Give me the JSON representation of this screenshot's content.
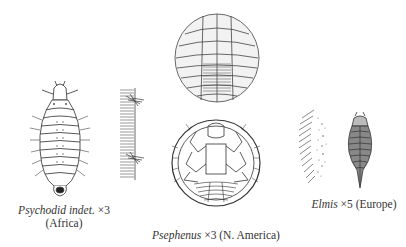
{
  "figure": {
    "specimens": [
      {
        "id": "psychodid",
        "genus": "Psychodid indet.",
        "magnification": "×3",
        "region": "(Africa)",
        "caption_line1_rest": " ×3",
        "caption_line2": "(Africa)",
        "views": [
          "dorsal larva"
        ]
      },
      {
        "id": "psephenus",
        "genus": "Psephenus",
        "magnification": "×3",
        "region": "(N. America)",
        "caption_rest": " ×3 (N. America)",
        "views": [
          "gill detail",
          "dorsal larva",
          "ventral larva"
        ]
      },
      {
        "id": "elmis",
        "genus": "Elmis",
        "magnification": "×5",
        "region": "(Europe)",
        "caption_rest": " ×5 (Europe)",
        "views": [
          "gill detail",
          "dorsal larva"
        ]
      }
    ]
  },
  "colors": {
    "ink": "#333333",
    "background": "#ffffff"
  }
}
